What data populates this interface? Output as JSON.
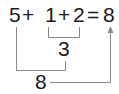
{
  "equation": {
    "tokens": [
      "5",
      "+",
      "1",
      "+",
      "2",
      "=",
      "8"
    ],
    "text": "5+1+2=8"
  },
  "steps": [
    {
      "operands": [
        "1",
        "2"
      ],
      "result": "3"
    },
    {
      "operands": [
        "5",
        "3"
      ],
      "result": "8"
    }
  ],
  "partial_sum": "3",
  "total_sum": "8",
  "colors": {
    "text": "#1a1a1a",
    "lines": "#8a8a8a",
    "background": "#ffffff"
  }
}
